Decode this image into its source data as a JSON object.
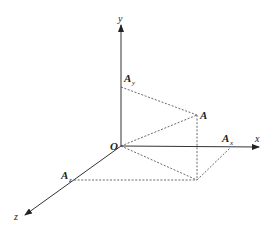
{
  "diagram": {
    "type": "3d-coordinate-projection",
    "origin": {
      "label": "O"
    },
    "axes": [
      {
        "name": "x",
        "label": "x"
      },
      {
        "name": "y",
        "label": "y"
      },
      {
        "name": "z",
        "label": "z"
      }
    ],
    "points": {
      "A": {
        "label": "A"
      },
      "Ax": {
        "label": "A",
        "subscript": "x"
      },
      "Ay": {
        "label": "A",
        "subscript": "y"
      },
      "Az": {
        "label": "A",
        "subscript": "z"
      }
    },
    "colors": {
      "line": "#333333",
      "dashed": "#444444",
      "background": "#ffffff"
    }
  }
}
